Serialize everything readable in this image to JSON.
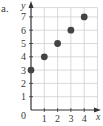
{
  "label": "a.",
  "chart_data": {
    "type": "scatter",
    "title": "",
    "xlabel": "x",
    "ylabel": "y",
    "x": [
      0,
      1,
      2,
      3,
      4
    ],
    "y": [
      3,
      4,
      5,
      6,
      7
    ],
    "xticks": [
      "0",
      "1",
      "2",
      "3",
      "4"
    ],
    "yticks": [
      "1",
      "2",
      "3",
      "4",
      "5",
      "6",
      "7"
    ],
    "xlim": [
      0,
      5
    ],
    "ylim": [
      0,
      7.7
    ],
    "grid": true,
    "legend": null,
    "colors": {
      "points": "#444444",
      "grid": "#cfcfcf",
      "axes": "#333333"
    }
  }
}
